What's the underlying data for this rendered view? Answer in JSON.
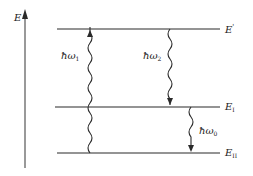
{
  "diagram": {
    "axis": {
      "label": "E"
    },
    "levels": [
      {
        "id": "E_prime",
        "label": "E",
        "sup": "'",
        "sub": ""
      },
      {
        "id": "E_I",
        "label": "E",
        "sup": "",
        "sub": "I"
      },
      {
        "id": "E_II",
        "label": "E",
        "sup": "",
        "sub": "II"
      }
    ],
    "transitions": [
      {
        "id": "absorption",
        "label": "ħω",
        "sub": "1",
        "direction": "up",
        "from": "E_II",
        "to": "E_prime"
      },
      {
        "id": "emission-2",
        "label": "ħω",
        "sub": "2",
        "direction": "down",
        "from": "E_prime",
        "to": "E_I"
      },
      {
        "id": "emission-0",
        "label": "ħω",
        "sub": "0",
        "direction": "down",
        "from": "E_I",
        "to": "E_II"
      }
    ],
    "colors": {
      "line": "#2a2a2a",
      "background": "#ffffff"
    }
  }
}
